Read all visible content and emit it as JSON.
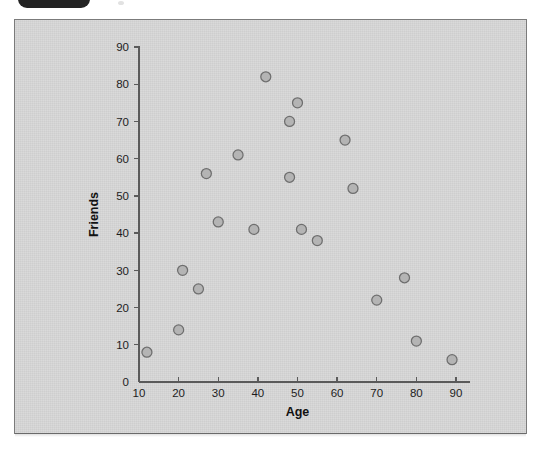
{
  "decor": {
    "badge_name": "window-tab-badge",
    "dot_name": "top-dot-marker"
  },
  "panel": {
    "background_color": "#d6d6d6",
    "border_color": "#7b7b7b"
  },
  "chart_data": {
    "type": "scatter",
    "title": "",
    "subtitle": "",
    "xlabel": "Age",
    "ylabel": "Friends",
    "xlim": [
      10,
      90
    ],
    "ylim": [
      0,
      90
    ],
    "xticks": [
      10,
      20,
      30,
      40,
      50,
      60,
      70,
      80,
      90
    ],
    "yticks": [
      0,
      10,
      20,
      30,
      40,
      50,
      60,
      70,
      80,
      90
    ],
    "xtick_labels": [
      "10",
      "20",
      "30",
      "40",
      "50",
      "60",
      "70",
      "80",
      "90"
    ],
    "ytick_labels": [
      "0",
      "10",
      "20",
      "30",
      "40",
      "50",
      "60",
      "70",
      "80",
      "90"
    ],
    "grid": false,
    "legend": false,
    "legend_position": "none",
    "marker": {
      "shape": "circle",
      "fill_color": "#b4b4b4",
      "edge_color": "#6e6e6e",
      "size": 5
    },
    "series": [
      {
        "name": "respondents",
        "points": [
          {
            "x": 12,
            "y": 8
          },
          {
            "x": 20,
            "y": 14
          },
          {
            "x": 21,
            "y": 30
          },
          {
            "x": 25,
            "y": 25
          },
          {
            "x": 27,
            "y": 56
          },
          {
            "x": 30,
            "y": 43
          },
          {
            "x": 35,
            "y": 61
          },
          {
            "x": 39,
            "y": 41
          },
          {
            "x": 42,
            "y": 82
          },
          {
            "x": 48,
            "y": 55
          },
          {
            "x": 48,
            "y": 70
          },
          {
            "x": 50,
            "y": 75
          },
          {
            "x": 51,
            "y": 41
          },
          {
            "x": 55,
            "y": 38
          },
          {
            "x": 62,
            "y": 65
          },
          {
            "x": 64,
            "y": 52
          },
          {
            "x": 70,
            "y": 22
          },
          {
            "x": 77,
            "y": 28
          },
          {
            "x": 80,
            "y": 11
          },
          {
            "x": 89,
            "y": 6
          }
        ]
      }
    ],
    "x": [
      12,
      20,
      21,
      25,
      27,
      30,
      35,
      39,
      42,
      48,
      48,
      50,
      51,
      55,
      62,
      64,
      70,
      77,
      80,
      89
    ],
    "y": [
      8,
      14,
      30,
      25,
      56,
      43,
      61,
      41,
      82,
      55,
      70,
      75,
      41,
      38,
      65,
      52,
      22,
      28,
      11,
      6
    ]
  }
}
